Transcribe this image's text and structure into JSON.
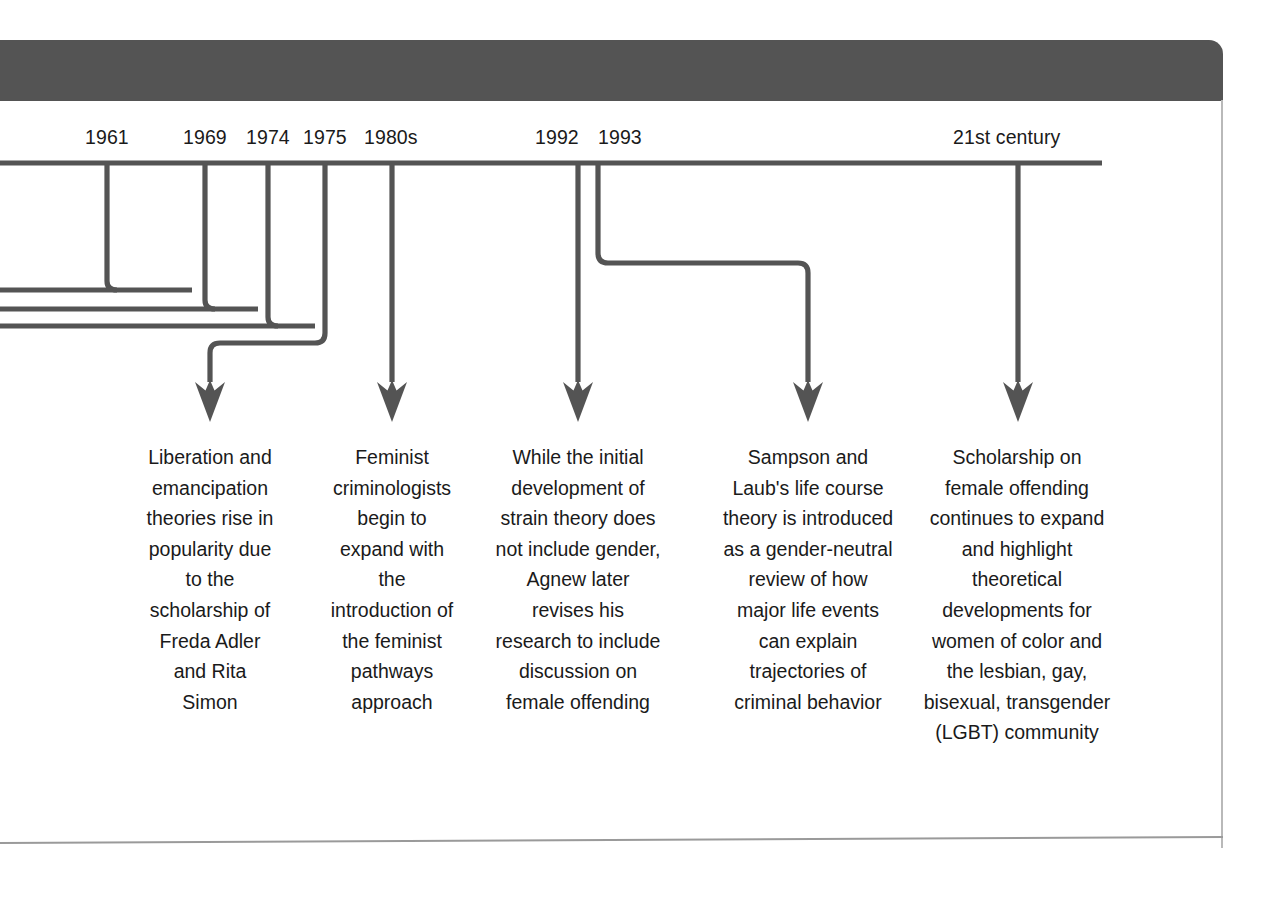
{
  "diagram": {
    "type": "horizontal timeline with branching connectors",
    "line_color": "#545454",
    "text_color": "#1a1a1a",
    "background": "#ffffff",
    "header_band_color": "#545454"
  },
  "axis": {
    "orientation": "horizontal",
    "left_edge_open": true,
    "note": "Timeline axis continues off the left edge of the page; three connector lines enter from the left margin."
  },
  "years": [
    {
      "label": "1961",
      "x": 107
    },
    {
      "label": "1969",
      "x": 205
    },
    {
      "label": "1974",
      "x": 268
    },
    {
      "label": "1975",
      "x": 325
    },
    {
      "label": "1980s",
      "x": 392
    },
    {
      "label": "1992",
      "x": 557
    },
    {
      "label": "1993",
      "x": 620
    },
    {
      "label": "21st century",
      "x": 1018
    }
  ],
  "entries": [
    {
      "id": "entry-1961-1975",
      "year_keys": [
        "1961",
        "1969",
        "1974",
        "1975"
      ],
      "arrow_x": 210,
      "text": "Liberation and emancipation theories rise in popularity due to the scholarship of Freda Adler and Rita Simon"
    },
    {
      "id": "entry-1980s",
      "year_keys": [
        "1980s"
      ],
      "arrow_x": 392,
      "text": "Feminist criminologists begin to expand with the introduction of the feminist pathways approach"
    },
    {
      "id": "entry-1992",
      "year_keys": [
        "1992"
      ],
      "arrow_x": 578,
      "text": "While the initial development of strain theory does not include gender, Agnew later revises his research to include discussion on female offending"
    },
    {
      "id": "entry-1993",
      "year_keys": [
        "1993"
      ],
      "arrow_x": 808,
      "text": "Sampson and Laub's life course theory is introduced as a gender-neutral review of how major life events can explain trajectories of criminal behavior"
    },
    {
      "id": "entry-21st-century",
      "year_keys": [
        "21st century"
      ],
      "arrow_x": 1018,
      "text": "Scholarship on female offending continues to expand and highlight theoretical developments for women of color and the lesbian, gay, bisexual, transgender (LGBT) community"
    }
  ]
}
